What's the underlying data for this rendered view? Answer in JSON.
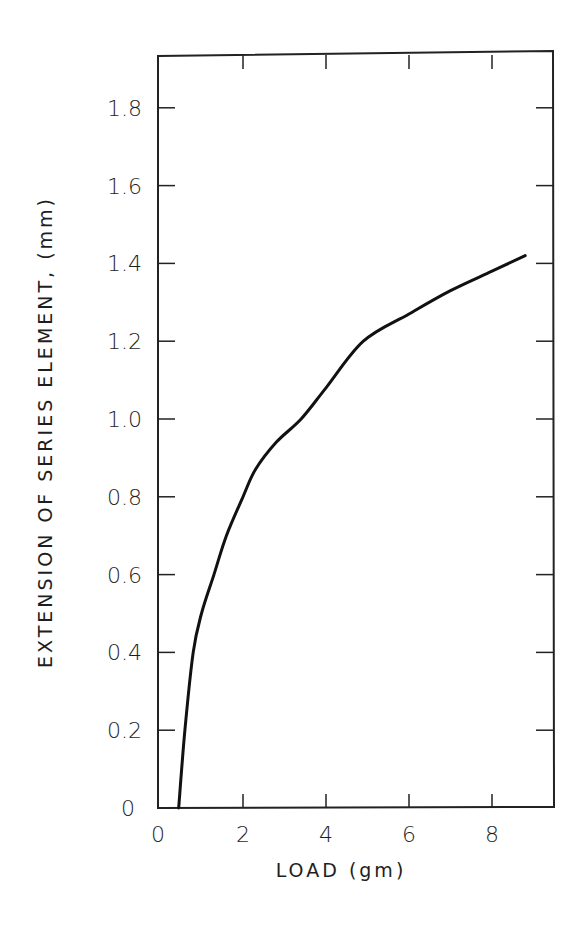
{
  "chart_data": {
    "type": "line",
    "title": "",
    "xlabel": "LOAD (gm)",
    "ylabel": "EXTENSION OF SERIES ELEMENT, (mm)",
    "xlim": [
      0,
      9.5
    ],
    "ylim": [
      0,
      1.98
    ],
    "x_ticks": [
      0,
      2,
      4,
      6,
      8
    ],
    "x_tick_labels": [
      "0",
      "2",
      "4",
      "6",
      "8"
    ],
    "y_ticks": [
      0,
      0.2,
      0.4,
      0.6,
      0.8,
      1.0,
      1.2,
      1.4,
      1.6,
      1.8
    ],
    "y_tick_labels": [
      "0",
      "0.2",
      "0.4",
      "0.6",
      "0.8",
      "1.0",
      "1.2",
      "1.4",
      "1.6",
      "1.8"
    ],
    "grid": false,
    "legend": null,
    "series": [
      {
        "name": "Extension vs load",
        "x": [
          0.45,
          0.6,
          0.8,
          1.0,
          1.3,
          1.6,
          2.0,
          2.3,
          2.8,
          3.4,
          4.0,
          4.9,
          6.0,
          7.0,
          8.0,
          8.8
        ],
        "y": [
          0.0,
          0.2,
          0.4,
          0.5,
          0.6,
          0.7,
          0.8,
          0.87,
          0.94,
          1.0,
          1.08,
          1.2,
          1.27,
          1.33,
          1.38,
          1.42
        ]
      }
    ],
    "colors": {
      "line": "#111111",
      "axes": "#222222",
      "background": "#ffffff"
    }
  }
}
